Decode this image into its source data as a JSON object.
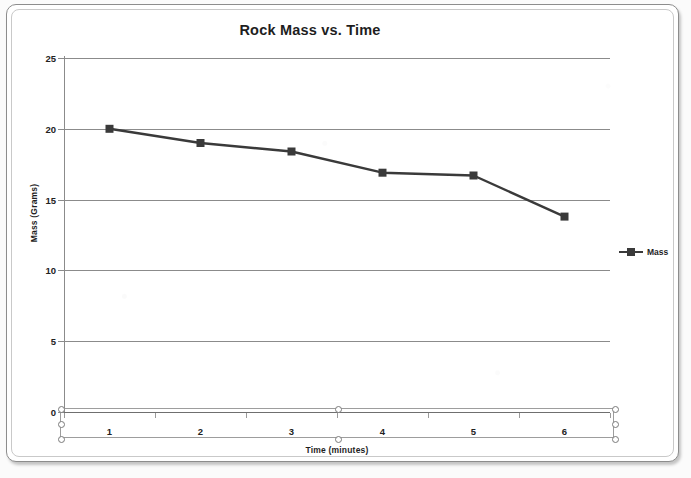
{
  "chart_data": {
    "type": "line",
    "title": "Rock Mass vs. Time",
    "xlabel": "Time (minutes)",
    "ylabel": "Mass (Grams)",
    "categories": [
      "1",
      "2",
      "3",
      "4",
      "5",
      "6"
    ],
    "series": [
      {
        "name": "Mass",
        "values": [
          20,
          19,
          18.4,
          16.9,
          16.7,
          13.8
        ],
        "color": "#3a3a3a",
        "marker": "square"
      }
    ],
    "ytick_labels": [
      "25",
      "20",
      "15",
      "10",
      "5",
      "0"
    ],
    "ytick_values": [
      25,
      20,
      15,
      10,
      5,
      0
    ],
    "ylim": [
      0,
      25
    ],
    "grid": "horizontal",
    "legend_position": "right",
    "legend_entries": [
      "Mass"
    ]
  },
  "legend": {
    "label": "Mass",
    "marker_icon": "line-square-marker-icon"
  },
  "axis_selection": {
    "handle_icon": "resize-handle-icon",
    "handle_count": 8
  },
  "colors": {
    "series": "#3a3a3a",
    "gridline": "#8b8b8b",
    "axis": "#6f6f6f",
    "text": "#1e1e1e",
    "frame": "#8d8d8d",
    "background": "#ffffff"
  }
}
